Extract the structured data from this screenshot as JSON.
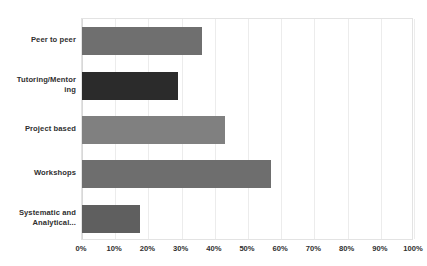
{
  "chart_data": {
    "type": "bar",
    "orientation": "horizontal",
    "title": "",
    "subtitle": "",
    "xlabel": "",
    "ylabel": "",
    "categories": [
      "Peer to peer",
      "Tutoring/Mentoring",
      "Project based",
      "Workshops",
      "Systematic and Analytical..."
    ],
    "category_display": [
      "Peer to peer",
      "Tutoring/Mentor\ning",
      "Project based",
      "Workshops",
      "Systematic and\nAnalytical..."
    ],
    "values": [
      36,
      29,
      43,
      57,
      17.5
    ],
    "value_labels": [
      "36%",
      "29%",
      "43%",
      "57%",
      "17.5%"
    ],
    "bar_colors": [
      "#6f6f6f",
      "#2b2b2b",
      "#808080",
      "#6e6e6e",
      "#5f5f5f"
    ],
    "xlim": [
      0,
      100
    ],
    "ylim": [
      0,
      5
    ],
    "xticks": [
      0,
      10,
      20,
      30,
      40,
      50,
      60,
      70,
      80,
      90,
      100
    ],
    "xtick_labels": [
      "0%",
      "10%",
      "20%",
      "30%",
      "40%",
      "50%",
      "60%",
      "70%",
      "80%",
      "90%",
      "100%"
    ],
    "grid": true,
    "grid_axis": "x",
    "grid_color": "#ececec",
    "legend": false,
    "legend_position": "none",
    "plot_border_color": "#e3e3e3",
    "background_color": "#ffffff",
    "tick_label_color": "#2f2f2f",
    "category_label_color": "#2f2f2f"
  }
}
